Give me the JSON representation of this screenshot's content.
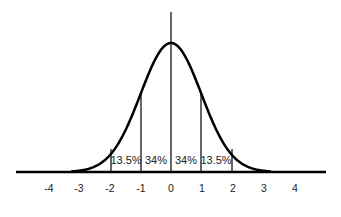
{
  "chart_data": {
    "type": "area",
    "title": "",
    "xlabel": "",
    "ylabel": "",
    "x_ticks": [
      "-4",
      "-3",
      "-2",
      "-1",
      "0",
      "1",
      "2",
      "3",
      "4"
    ],
    "xlim": [
      -5,
      5
    ],
    "grid": false,
    "regions": [
      {
        "from": -2,
        "to": -1,
        "label": "13.5%",
        "value": 13.5
      },
      {
        "from": -1,
        "to": 0,
        "label": "34%",
        "value": 34
      },
      {
        "from": 0,
        "to": 1,
        "label": "34%",
        "value": 34
      },
      {
        "from": 1,
        "to": 2,
        "label": "13.5%",
        "value": 13.5
      }
    ],
    "vertical_lines_at": [
      -2,
      -1,
      0,
      1,
      2
    ]
  },
  "colors": {
    "line": "#000000",
    "text": "#222222",
    "background": "#ffffff"
  }
}
